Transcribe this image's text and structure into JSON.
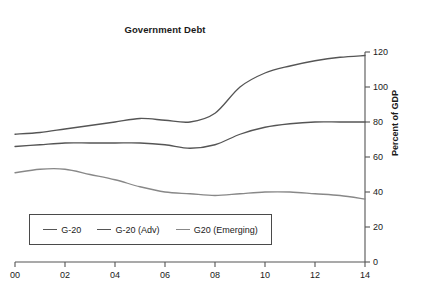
{
  "chart_data": {
    "type": "line",
    "title": "Government Debt",
    "xlabel": "",
    "ylabel": "Percent of GDP",
    "x": [
      2000,
      2001,
      2002,
      2003,
      2004,
      2005,
      2006,
      2007,
      2008,
      2009,
      2010,
      2011,
      2012,
      2013,
      2014
    ],
    "xtick_labels": [
      "00",
      "02",
      "04",
      "06",
      "08",
      "10",
      "12",
      "14"
    ],
    "xtick_values": [
      2000,
      2002,
      2004,
      2006,
      2008,
      2010,
      2012,
      2014
    ],
    "xlim": [
      2000,
      2014
    ],
    "ytick_labels": [
      "0",
      "20",
      "40",
      "60",
      "80",
      "100",
      "120"
    ],
    "ytick_values": [
      0,
      20,
      40,
      60,
      80,
      100,
      120
    ],
    "ylim": [
      0,
      120
    ],
    "y_axis_position": "right",
    "grid": false,
    "legend_position": "lower-left",
    "series": [
      {
        "name": "G-20 (Adv)",
        "color": "#555555",
        "values": [
          73,
          74,
          76,
          78,
          80,
          82,
          81,
          80,
          85,
          100,
          108,
          112,
          115,
          117,
          118
        ]
      },
      {
        "name": "G-20",
        "color": "#555555",
        "values": [
          66,
          67,
          68,
          68,
          68,
          68,
          67,
          65,
          67,
          73,
          77,
          79,
          80,
          80,
          80
        ]
      },
      {
        "name": "G20 (Emerging)",
        "color": "#888888",
        "values": [
          51,
          53,
          53,
          50,
          47,
          43,
          40,
          39,
          38,
          39,
          40,
          40,
          39,
          38,
          36
        ]
      }
    ]
  },
  "legend": {
    "entries": [
      {
        "label": "G-20"
      },
      {
        "label": "G-20 (Adv)"
      },
      {
        "label": "G20 (Emerging)"
      }
    ]
  }
}
